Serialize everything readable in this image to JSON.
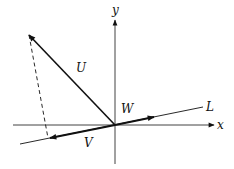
{
  "diagram": {
    "type": "vector-projection",
    "colors": {
      "stroke": "#111111",
      "background": "#ffffff"
    },
    "origin": [
      115,
      125
    ],
    "axes": {
      "x": {
        "label": "x",
        "from": [
          13,
          125
        ],
        "to": [
          214,
          125
        ],
        "label_pos": [
          217,
          129
        ]
      },
      "y": {
        "label": "y",
        "from": [
          115,
          164
        ],
        "to": [
          115,
          20
        ],
        "label_pos": [
          112,
          14
        ]
      }
    },
    "line_L": {
      "label": "L",
      "from": [
        20,
        144
      ],
      "to": [
        203,
        107
      ],
      "label_pos": [
        206,
        111
      ]
    },
    "vectors": [
      {
        "name": "U",
        "label": "U",
        "from": [
          115,
          125
        ],
        "to": [
          29,
          35
        ],
        "label_pos": [
          76,
          72
        ]
      },
      {
        "name": "W",
        "label": "W",
        "from": [
          115,
          125
        ],
        "to": [
          154,
          117
        ],
        "label_pos": [
          121,
          113
        ]
      },
      {
        "name": "V",
        "label": "V",
        "from": [
          115,
          125
        ],
        "to": [
          50,
          138
        ],
        "label_pos": [
          84,
          147
        ]
      }
    ],
    "dashed_projection": {
      "from": [
        29,
        35
      ],
      "to": [
        48,
        138
      ]
    }
  }
}
